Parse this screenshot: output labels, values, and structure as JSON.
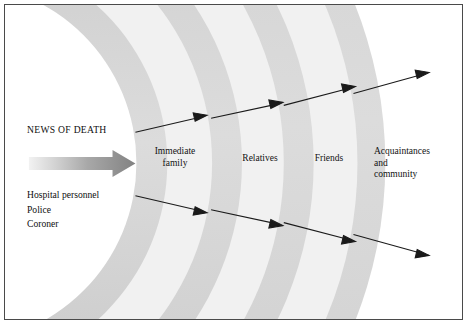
{
  "figure": {
    "title": "NEWS OF DEATH",
    "source_label": "news-of-death-arrow",
    "news_label": "NEWS OF DEATH",
    "sources": [
      "Hospital personnel",
      "Police",
      "Coroner"
    ],
    "rings": [
      {
        "id": "immediate-family",
        "label": "Immediate\nfamily"
      },
      {
        "id": "relatives",
        "label": "Relatives"
      },
      {
        "id": "friends",
        "label": "Friends"
      },
      {
        "id": "acquaintances",
        "label": "Acquaintances\nand\ncommunity"
      }
    ],
    "colors": {
      "band": "#d9d9d9",
      "gap": "#f1f1f1",
      "background": "#ffffff",
      "border": "#4a4a4a",
      "text": "#0f0f0f",
      "arrow_start": "#f0f0f0",
      "arrow_end": "#8a8a8a",
      "line": "#1a1a1a"
    },
    "flow_arrows": {
      "upper_count": 4,
      "lower_count": 4,
      "direction": "outward"
    }
  }
}
